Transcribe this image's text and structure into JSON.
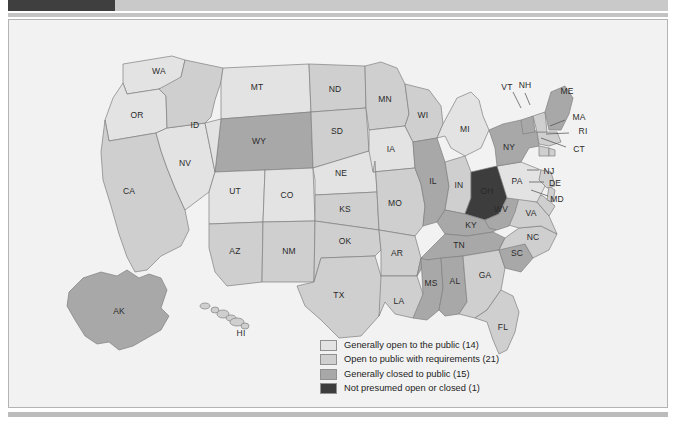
{
  "page": {
    "background": "#ffffff",
    "panel_background": "#f2f2f2",
    "panel_border": "#b4b4b4"
  },
  "chrome": {
    "top_block_color": "#3f3f3f",
    "top_bar_color": "#c9c9c9",
    "rule_color": "#c3c3c3",
    "bottom_rule_color": "#bcbcbc"
  },
  "palette": {
    "open": "#e3e3e3",
    "requirements": "#cfcfcf",
    "closed": "#a8a8a8",
    "not_presumed": "#3d3d3d",
    "ocean": "#f2f2f2",
    "border": "#808080",
    "label": "#2a2a2a"
  },
  "legend": {
    "items": [
      {
        "label": "Generally open to the public (14)",
        "color": "#e3e3e3",
        "key": "open",
        "count": 14
      },
      {
        "label": "Open to public with requirements (21)",
        "color": "#cfcfcf",
        "key": "requirements",
        "count": 21
      },
      {
        "label": "Generally closed to public (15)",
        "color": "#a8a8a8",
        "key": "closed",
        "count": 15
      },
      {
        "label": "Not presumed open or closed (1)",
        "color": "#3d3d3d",
        "key": "not_presumed",
        "count": 1
      }
    ]
  },
  "chart_data": {
    "type": "map",
    "title": "",
    "legend_position": "bottom-center",
    "categories": [
      "Generally open to the public",
      "Open to public with requirements",
      "Generally closed to public",
      "Not presumed open or closed"
    ],
    "values": [
      14,
      21,
      15,
      1
    ],
    "states": [
      {
        "code": "WA",
        "category": "open"
      },
      {
        "code": "OR",
        "category": "open"
      },
      {
        "code": "ID",
        "category": "requirements"
      },
      {
        "code": "MT",
        "category": "open"
      },
      {
        "code": "WY",
        "category": "closed"
      },
      {
        "code": "ND",
        "category": "requirements"
      },
      {
        "code": "SD",
        "category": "requirements"
      },
      {
        "code": "MN",
        "category": "requirements"
      },
      {
        "code": "WI",
        "category": "requirements"
      },
      {
        "code": "MI",
        "category": "open"
      },
      {
        "code": "IA",
        "category": "open"
      },
      {
        "code": "NE",
        "category": "open"
      },
      {
        "code": "CA",
        "category": "requirements"
      },
      {
        "code": "NV",
        "category": "open"
      },
      {
        "code": "UT",
        "category": "open"
      },
      {
        "code": "CO",
        "category": "open"
      },
      {
        "code": "AZ",
        "category": "requirements"
      },
      {
        "code": "NM",
        "category": "requirements"
      },
      {
        "code": "KS",
        "category": "requirements"
      },
      {
        "code": "OK",
        "category": "requirements"
      },
      {
        "code": "TX",
        "category": "requirements"
      },
      {
        "code": "MO",
        "category": "requirements"
      },
      {
        "code": "AR",
        "category": "requirements"
      },
      {
        "code": "LA",
        "category": "requirements"
      },
      {
        "code": "IL",
        "category": "closed"
      },
      {
        "code": "IN",
        "category": "requirements"
      },
      {
        "code": "OH",
        "category": "not_presumed"
      },
      {
        "code": "KY",
        "category": "closed"
      },
      {
        "code": "TN",
        "category": "closed"
      },
      {
        "code": "MS",
        "category": "closed"
      },
      {
        "code": "AL",
        "category": "closed"
      },
      {
        "code": "GA",
        "category": "requirements"
      },
      {
        "code": "FL",
        "category": "requirements"
      },
      {
        "code": "SC",
        "category": "closed"
      },
      {
        "code": "NC",
        "category": "requirements"
      },
      {
        "code": "VA",
        "category": "requirements"
      },
      {
        "code": "WV",
        "category": "closed"
      },
      {
        "code": "MD",
        "category": "requirements"
      },
      {
        "code": "DE",
        "category": "requirements"
      },
      {
        "code": "PA",
        "category": "open"
      },
      {
        "code": "NJ",
        "category": "requirements"
      },
      {
        "code": "NY",
        "category": "closed"
      },
      {
        "code": "CT",
        "category": "requirements"
      },
      {
        "code": "RI",
        "category": "requirements"
      },
      {
        "code": "MA",
        "category": "requirements"
      },
      {
        "code": "VT",
        "category": "closed"
      },
      {
        "code": "NH",
        "category": "requirements"
      },
      {
        "code": "ME",
        "category": "closed"
      },
      {
        "code": "AK",
        "category": "closed"
      },
      {
        "code": "HI",
        "category": "requirements"
      }
    ],
    "labels": {
      "WA": "WA",
      "OR": "OR",
      "ID": "ID",
      "MT": "MT",
      "WY": "WY",
      "ND": "ND",
      "SD": "SD",
      "MN": "MN",
      "WI": "WI",
      "MI": "MI",
      "IA": "IA",
      "NE": "NE",
      "CA": "CA",
      "NV": "NV",
      "UT": "UT",
      "CO": "CO",
      "AZ": "AZ",
      "NM": "NM",
      "KS": "KS",
      "OK": "OK",
      "TX": "TX",
      "MO": "MO",
      "AR": "AR",
      "LA": "LA",
      "IL": "IL",
      "IN": "IN",
      "OH": "OH",
      "KY": "KY",
      "TN": "TN",
      "MS": "MS",
      "AL": "AL",
      "GA": "GA",
      "FL": "FL",
      "SC": "SC",
      "NC": "NC",
      "VA": "VA",
      "WV": "WV",
      "MD": "MD",
      "DE": "DE",
      "PA": "PA",
      "NJ": "NJ",
      "NY": "NY",
      "CT": "CT",
      "RI": "RI",
      "MA": "MA",
      "VT": "VT",
      "NH": "NH",
      "ME": "ME",
      "AK": "AK",
      "HI": "HI"
    }
  }
}
